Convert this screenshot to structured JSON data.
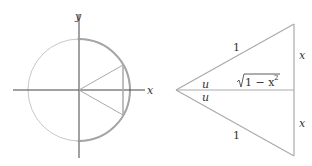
{
  "left_figure": {
    "axis_x_label": "x",
    "axis_y_label": "y",
    "colors": {
      "axis": "#333333",
      "circle": "#bbbbbb",
      "arc_highlight": "#999999",
      "lines": "#aaaaaa"
    }
  },
  "right_figure": {
    "hypotenuse_top_label": "1",
    "hypotenuse_bottom_label": "1",
    "angle_top_label": "u",
    "angle_bottom_label": "u",
    "middle_label": "√1 − x²",
    "middle_label_radical": "√",
    "middle_label_body": "1 − x",
    "middle_label_exp": "2",
    "side_top_label": "x",
    "side_bottom_label": "x",
    "colors": {
      "lines": "#aaaaaa"
    }
  }
}
